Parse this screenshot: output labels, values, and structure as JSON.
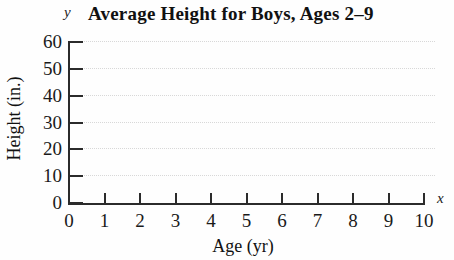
{
  "chart_data": {
    "type": "line",
    "title": "Average Height for Boys, Ages 2–9",
    "subtitle": "",
    "xlabel": "Age (yr)",
    "ylabel": "Height (in.)",
    "x_axis_letter": "x",
    "y_axis_letter": "y",
    "xlim": [
      0,
      10
    ],
    "ylim": [
      0,
      60
    ],
    "x_ticks": [
      0,
      1,
      2,
      3,
      4,
      5,
      6,
      7,
      8,
      9,
      10
    ],
    "y_ticks": [
      0,
      10,
      20,
      30,
      40,
      50,
      60
    ],
    "x_tick_labels": [
      "0",
      "1",
      "2",
      "3",
      "4",
      "5",
      "6",
      "7",
      "8",
      "9",
      "10"
    ],
    "y_tick_labels": [
      "0",
      "10",
      "20",
      "30",
      "40",
      "50",
      "60"
    ],
    "grid": {
      "horizontal": true,
      "vertical": false,
      "style": "dotted",
      "color": "#d8d8d8"
    },
    "legend": null,
    "series": [],
    "annotations": [],
    "axis_color": "#2b2b2b",
    "text_color": "#1a1a1a",
    "background": "#fefefe"
  }
}
